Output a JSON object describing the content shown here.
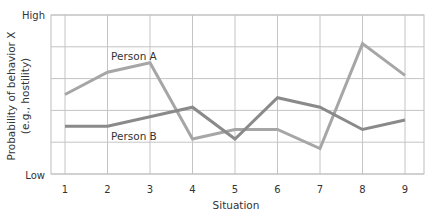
{
  "chart_data": {
    "type": "line",
    "title": "",
    "xlabel": "Situation",
    "ylabel": "Probability of behavior X",
    "ylabel_sub": "(e.g., hostility)",
    "x": [
      1,
      2,
      3,
      4,
      5,
      6,
      7,
      8,
      9
    ],
    "categories": [
      "1",
      "2",
      "3",
      "4",
      "5",
      "6",
      "7",
      "8",
      "9"
    ],
    "y_tick_labels": {
      "top": "High",
      "bottom": "Low"
    },
    "ylim": [
      0,
      5
    ],
    "y_gridlines": [
      0,
      1,
      2,
      3,
      4,
      5
    ],
    "grid": true,
    "legend": "inline labels",
    "series": [
      {
        "name": "Person A",
        "color": "#a6a6a6",
        "values": [
          2.5,
          3.2,
          3.5,
          1.1,
          1.4,
          1.4,
          0.8,
          4.1,
          3.1
        ],
        "label_position": {
          "x": 3,
          "y_offset": "above"
        }
      },
      {
        "name": "Person B",
        "color": "#8a8a8a",
        "values": [
          1.5,
          1.5,
          1.8,
          2.1,
          1.1,
          2.4,
          2.1,
          1.4,
          1.7
        ],
        "label_position": {
          "x": 2.5,
          "y_offset": "below"
        }
      }
    ]
  },
  "labels": {
    "y_high": "High",
    "y_low": "Low",
    "y_title_line1": "Probability of behavior X",
    "y_title_line2": "(e.g., hostility)",
    "x_title": "Situation",
    "person_a": "Person A",
    "person_b": "Person B"
  }
}
